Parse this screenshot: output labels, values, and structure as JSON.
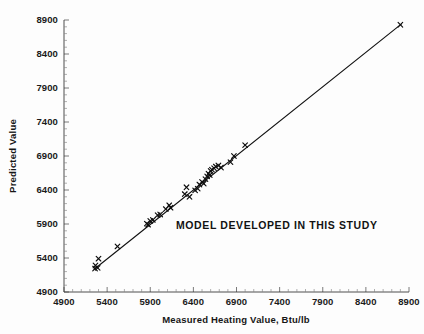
{
  "chart_data": {
    "type": "scatter",
    "title": "",
    "xlabel": "Measured Heating Value, Btu/lb",
    "ylabel": "Predicted Value",
    "xlim": [
      4900,
      8900
    ],
    "ylim": [
      4900,
      8900
    ],
    "xticks": [
      4900,
      5400,
      5900,
      6400,
      6900,
      7400,
      7900,
      8400,
      8900
    ],
    "yticks": [
      4900,
      5400,
      5900,
      6400,
      6900,
      7400,
      7900,
      8400,
      8900
    ],
    "xtick_labels": [
      "4900",
      "5400",
      "5900",
      "6400",
      "6900",
      "7400",
      "7900",
      "8400",
      "8900"
    ],
    "ytick_labels": [
      "4900",
      "5400",
      "5900",
      "6400",
      "6900",
      "7400",
      "7900",
      "8400",
      "8900"
    ],
    "grid": false,
    "legend": null,
    "marker_symbol": "x",
    "annotations": [
      {
        "text": "MODEL   DEVELOPED IN THIS STUDY",
        "x": 6500,
        "y": 6000
      }
    ],
    "series": [
      {
        "name": "Predicted vs Measured",
        "marker": "x",
        "points": [
          [
            5260,
            5245
          ],
          [
            5265,
            5290
          ],
          [
            5290,
            5255
          ],
          [
            5300,
            5390
          ],
          [
            5520,
            5570
          ],
          [
            5860,
            5905
          ],
          [
            5875,
            5890
          ],
          [
            5900,
            5945
          ],
          [
            5930,
            5960
          ],
          [
            5985,
            6030
          ],
          [
            6015,
            6040
          ],
          [
            6080,
            6120
          ],
          [
            6120,
            6175
          ],
          [
            6135,
            6140
          ],
          [
            6300,
            6340
          ],
          [
            6320,
            6440
          ],
          [
            6355,
            6300
          ],
          [
            6420,
            6395
          ],
          [
            6450,
            6420
          ],
          [
            6470,
            6480
          ],
          [
            6500,
            6520
          ],
          [
            6520,
            6495
          ],
          [
            6540,
            6560
          ],
          [
            6560,
            6600
          ],
          [
            6575,
            6640
          ],
          [
            6590,
            6620
          ],
          [
            6600,
            6680
          ],
          [
            6615,
            6700
          ],
          [
            6640,
            6720
          ],
          [
            6660,
            6745
          ],
          [
            6690,
            6760
          ],
          [
            6720,
            6730
          ],
          [
            6830,
            6810
          ],
          [
            6870,
            6900
          ],
          [
            7000,
            7060
          ],
          [
            8800,
            8830
          ]
        ]
      }
    ],
    "fit_line": {
      "name": "1:1 model line",
      "x": [
        5250,
        8810
      ],
      "y": [
        5235,
        8840
      ]
    }
  },
  "figure": {
    "background_color": "#fdfdfd",
    "axis_color": "#3a3a3a",
    "marker_color": "#0d0d0d",
    "line_color": "#121212"
  }
}
